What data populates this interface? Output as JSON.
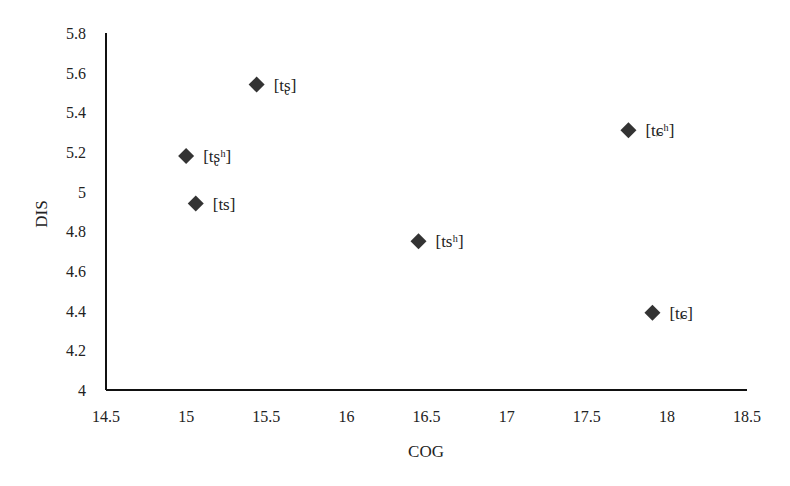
{
  "chart_data": {
    "type": "scatter",
    "title": "",
    "xlabel": "COG",
    "ylabel": "DIS",
    "xlim": [
      14.5,
      18.5
    ],
    "ylim": [
      4,
      5.8
    ],
    "xticks": [
      "14.5",
      "15",
      "15.5",
      "16",
      "16.5",
      "17",
      "17.5",
      "18",
      "18.5"
    ],
    "yticks": [
      "4",
      "4.2",
      "4.4",
      "4.6",
      "4.8",
      "5",
      "5.2",
      "5.4",
      "5.6",
      "5.8"
    ],
    "grid": false,
    "legend": null,
    "marker": "diamond",
    "marker_color": "#333333",
    "points": [
      {
        "label": "[tʂ]",
        "x": 15.44,
        "y": 5.54
      },
      {
        "label": "[tʂʰ]",
        "x": 15.0,
        "y": 5.18
      },
      {
        "label": "[ts]",
        "x": 15.06,
        "y": 4.94
      },
      {
        "label": "[tsʰ]",
        "x": 16.45,
        "y": 4.75
      },
      {
        "label": "[tɕʰ]",
        "x": 17.76,
        "y": 5.31
      },
      {
        "label": "[tɕ]",
        "x": 17.91,
        "y": 4.39
      }
    ]
  }
}
